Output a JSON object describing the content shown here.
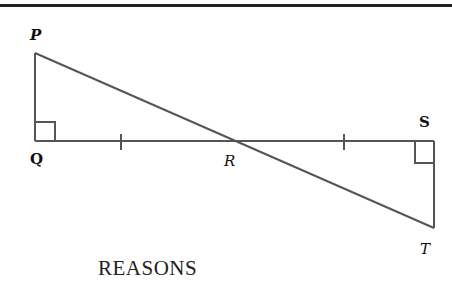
{
  "diagram": {
    "points": {
      "P": {
        "label": "P",
        "x": 35,
        "y": 53
      },
      "Q": {
        "label": "Q",
        "x": 35,
        "y": 141
      },
      "R": {
        "label": "R",
        "x": 233,
        "y": 141
      },
      "S": {
        "label": "S",
        "x": 434,
        "y": 141
      },
      "T": {
        "label": "T",
        "x": 434,
        "y": 228
      }
    },
    "segments": [
      "PQ",
      "QS",
      "PT",
      "ST"
    ],
    "right_angles": [
      "Q",
      "S"
    ],
    "congruence_ticks": [
      "QR",
      "RS"
    ],
    "line_color": "#555555"
  },
  "text": {
    "reasons_heading": "REASONS"
  }
}
